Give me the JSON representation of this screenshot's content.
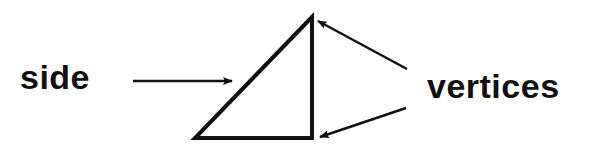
{
  "diagram": {
    "type": "labeled-triangle",
    "labels": {
      "side": "side",
      "vertices": "vertices"
    },
    "triangle": {
      "vertices": [
        [
          312,
          17
        ],
        [
          195,
          138
        ],
        [
          312,
          138
        ]
      ],
      "stroke": "#111111",
      "stroke_width": 4
    },
    "arrows": [
      {
        "name": "side-arrow",
        "from": [
          133,
          81
        ],
        "to": [
          232,
          81
        ],
        "points_to": "hypotenuse side"
      },
      {
        "name": "vertex-arrow-top",
        "from": [
          407,
          69
        ],
        "to": [
          318,
          21
        ],
        "points_to": "top vertex"
      },
      {
        "name": "vertex-arrow-bottom",
        "from": [
          406,
          108
        ],
        "to": [
          320,
          137
        ],
        "points_to": "bottom-right vertex"
      }
    ],
    "colors": {
      "ink": "#111111",
      "background": "#ffffff"
    }
  }
}
